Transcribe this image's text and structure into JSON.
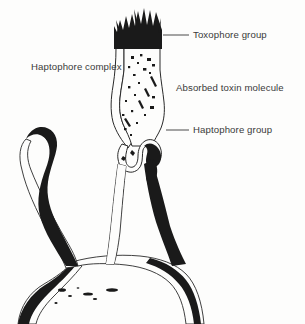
{
  "figure": {
    "background_color": "#fdfdfc",
    "ink_color": "#1a1a1a",
    "text_color": "#3a3a3a",
    "labels": [
      {
        "id": "toxophore-group",
        "text": "Toxophore group",
        "has_leader": true
      },
      {
        "id": "absorbed-toxin",
        "text": "Absorbed toxin molecule",
        "has_leader": false
      },
      {
        "id": "haptophore-group",
        "text": "Haptophore group",
        "has_leader": true
      },
      {
        "id": "haptophore-complex",
        "text": "Haptophore complex",
        "has_leader": false
      }
    ],
    "parts": [
      {
        "name": "toxophore-cap",
        "description": "black bristled cap at top of column"
      },
      {
        "name": "toxin-column",
        "description": "speckled vertical column"
      },
      {
        "name": "haptophore-fork",
        "description": "forked notch at base of column"
      },
      {
        "name": "left-arm",
        "description": "long curved arm with inked edge"
      },
      {
        "name": "cell-base",
        "description": "broad mound at bottom"
      }
    ]
  }
}
